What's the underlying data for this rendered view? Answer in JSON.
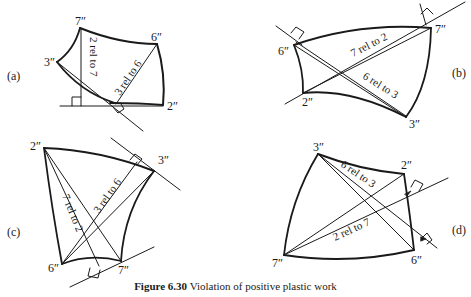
{
  "figure": {
    "caption_label": "Figure 6.30",
    "caption_text": " Violation of positive plastic work",
    "top_cut_text": "Fig. 6.30 b. ... ... ... g"
  },
  "panels": [
    {
      "id": "a",
      "label": "(a)",
      "vertices": {
        "7": "7″",
        "6": "6″",
        "3": "3″",
        "2": "2″"
      },
      "relations": [
        "2 rel to 7",
        "3 rel to 6"
      ]
    },
    {
      "id": "b",
      "label": "(b)",
      "vertices": {
        "6": "6″",
        "7": "7″",
        "2": "2″",
        "3": "3″"
      },
      "relations": [
        "7 rel to 2",
        "6 rel to 3"
      ]
    },
    {
      "id": "c",
      "label": "(c)",
      "vertices": {
        "2": "2″",
        "3": "3″",
        "6": "6″",
        "7": "7″"
      },
      "relations": [
        "7 rel to 2",
        "3 rel to 6"
      ]
    },
    {
      "id": "d",
      "label": "(d)",
      "vertices": {
        "3": "3″",
        "2": "2″",
        "7": "7″",
        "6": "6″"
      },
      "relations": [
        "6 rel to 3",
        "2 rel to 7"
      ]
    }
  ]
}
